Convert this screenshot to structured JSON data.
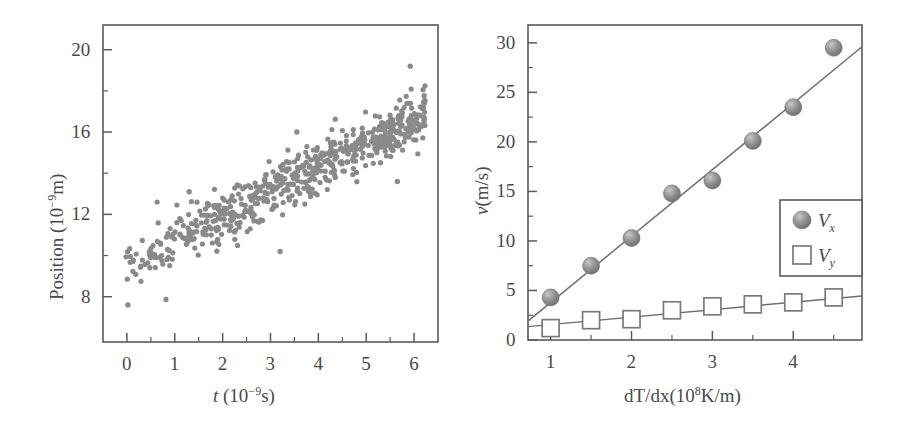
{
  "figure": {
    "background": "#ffffff",
    "ink": "#5a5a5a",
    "marker_color": "#8a8a8a"
  },
  "chart_data": [
    {
      "id": "left-panel",
      "type": "scatter",
      "title": "",
      "xlabel": "t (10−9s)",
      "xlabel_parts": {
        "symbol": "t",
        "unit_prefix": "(10",
        "exponent": "−9",
        "unit_suffix": "s)"
      },
      "ylabel": "Position (10−9m)",
      "ylabel_parts": {
        "name": "Position",
        "unit_prefix": "(10",
        "exponent": "−9",
        "unit_suffix": "m)"
      },
      "xlim": [
        -0.5,
        6.5
      ],
      "ylim": [
        5.8,
        21.2
      ],
      "xticks": [
        0,
        1,
        2,
        3,
        4,
        5,
        6
      ],
      "xticklabels": [
        "0",
        "1",
        "2",
        "3",
        "4",
        "5",
        "6"
      ],
      "xminorticks": [
        0.5,
        1.5,
        2.5,
        3.5,
        4.5,
        5.5
      ],
      "yticks": [
        8,
        12,
        16,
        20
      ],
      "yticklabels": [
        "8",
        "12",
        "16",
        "20"
      ],
      "yminorticks": [
        10,
        14,
        18
      ],
      "grid": false,
      "legend": null,
      "series": [
        {
          "name": "Position vs time",
          "marker": "filled-circle",
          "n_points": 620,
          "color": "#8a8a8a",
          "trend": {
            "intercept": 9.55,
            "slope": 1.18,
            "noise_sigma": 0.62
          },
          "description": "Dense noisy cloud of points rising linearly from about 9.5 at t=0 to about 16.8 at t=6.2"
        }
      ]
    },
    {
      "id": "right-panel",
      "type": "scatter",
      "title": "",
      "xlabel": "dT/dx(108K/m)",
      "xlabel_parts": {
        "name": "dT/dx(10",
        "exponent": "8",
        "unit_suffix": "K/m)"
      },
      "ylabel": "v(m/s)",
      "ylabel_parts": {
        "symbol": "v",
        "unit": "(m/s)"
      },
      "xlim": [
        0.72,
        4.85
      ],
      "ylim": [
        0,
        31.8
      ],
      "xticks": [
        1,
        2,
        3,
        4
      ],
      "xticklabels": [
        "1",
        "2",
        "3",
        "4"
      ],
      "xminorticks": [
        1.5,
        2.5,
        3.5,
        4.5
      ],
      "yticks": [
        0,
        5,
        10,
        15,
        20,
        25,
        30
      ],
      "yticklabels": [
        "0",
        "5",
        "10",
        "15",
        "20",
        "25",
        "30"
      ],
      "yminorticks": [
        2.5,
        7.5,
        12.5,
        17.5,
        22.5,
        27.5
      ],
      "grid": false,
      "legend": {
        "position": "center-right",
        "entries": [
          "Vx",
          "Vy"
        ]
      },
      "x": [
        1.0,
        1.5,
        2.0,
        2.5,
        3.0,
        3.5,
        4.0,
        4.5
      ],
      "series": [
        {
          "name": "Vx",
          "label_base": "V",
          "label_sub": "x",
          "marker": "sphere",
          "color": "#8a8a8a",
          "values": [
            4.3,
            7.5,
            10.3,
            14.8,
            16.1,
            20.1,
            23.5,
            29.5
          ],
          "fit": {
            "x": [
              0.72,
              4.85
            ],
            "y": [
              1.9,
              29.6
            ]
          }
        },
        {
          "name": "Vy",
          "label_base": "V",
          "label_sub": "y",
          "marker": "open-square",
          "color": "#ffffff",
          "edge_color": "#7a7a7a",
          "values": [
            1.2,
            2.0,
            2.1,
            3.0,
            3.4,
            3.6,
            3.8,
            4.3
          ],
          "fit": {
            "x": [
              0.72,
              4.85
            ],
            "y": [
              1.35,
              4.45
            ]
          }
        }
      ]
    }
  ]
}
